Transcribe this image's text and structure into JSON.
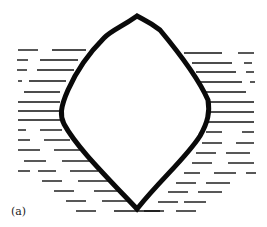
{
  "figure": {
    "panel_label": "(a)",
    "colors": {
      "outline": "#0a0a0a",
      "hatch": "#111111",
      "background": "#ffffff"
    }
  }
}
